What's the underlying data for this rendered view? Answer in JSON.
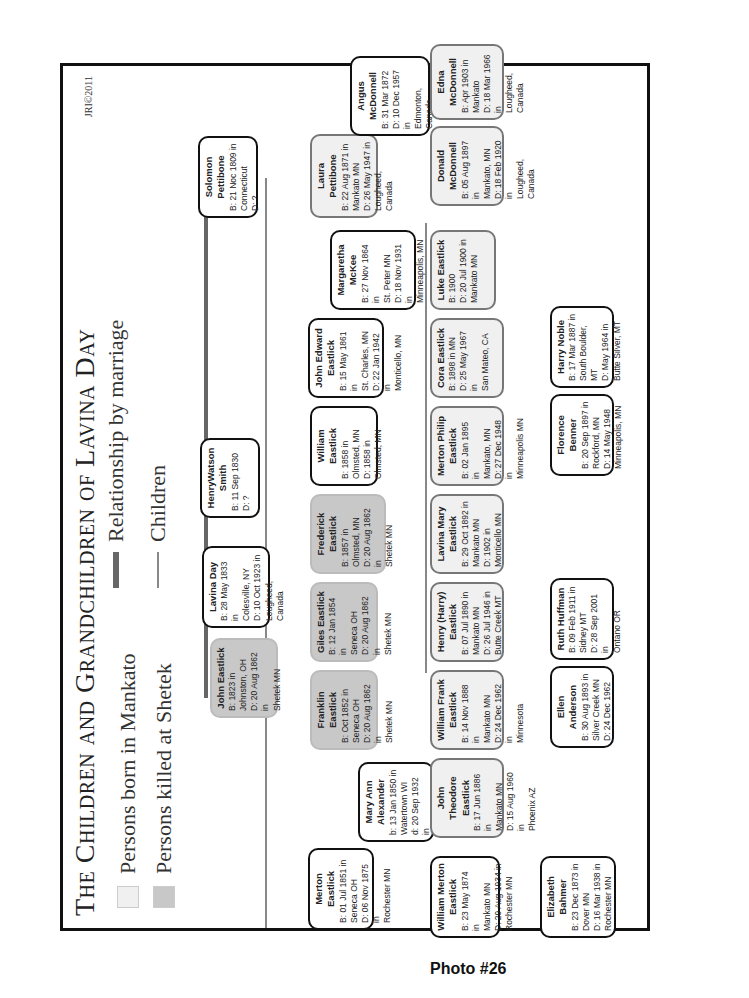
{
  "title": "The Children and Grandchildren of Lavina Day",
  "credit": "JRI©2011",
  "legend": {
    "born_mankato": "Persons born in Mankato",
    "killed_shetek": "Persons killed at Shetek",
    "marriage": "Relationship by marriage",
    "children": "Children"
  },
  "colors": {
    "mankato": "#f0f0f0",
    "shetek": "#c8c8c8",
    "marriage_line": "#666666",
    "children_line": "#888888"
  },
  "caption": "Photo #26",
  "people": {
    "john_eastlick": {
      "name": "John Eastlick",
      "b": "B: 1823 in",
      "b2": "Johnston, OH",
      "d": "D: 20 Aug 1862 in",
      "d2": "Shetek MN",
      "type": "shetek"
    },
    "lavina_day": {
      "name": "Lavina Day",
      "b": "B: 28 May 1833 in",
      "b2": "Colesville, NY",
      "d": "D: 10 Oct 1923 in",
      "d2": "Lougheed, Canada",
      "type": "normal"
    },
    "henry_watson_smith": {
      "name": "HenryWatson Smith",
      "b": "B: 11 Sep 1830",
      "b2": "",
      "d": "D: ?",
      "d2": "",
      "type": "normal"
    },
    "solomon_pettibone": {
      "name": "Solomon Pettibone",
      "b": "B: 21 Noc 1809 in",
      "b2": "Connecticut",
      "d": "D: ?",
      "d2": "",
      "type": "normal"
    },
    "merton_eastlick": {
      "name": "Merton Eastlick",
      "b": "B: 01 Jul 1851 in",
      "b2": "Seneca OH",
      "d": "D: 06 Nov 1875 in",
      "d2": "Rochester MN",
      "type": "normal"
    },
    "mary_ann_alexander": {
      "name": "Mary Ann Alexander",
      "b": "b: 13 Jan 1850 in",
      "b2": "Watertown WI",
      "d": "d: 20 Sep 1932 in",
      "d2": "Rochester MN",
      "type": "normal"
    },
    "franklin_eastlick": {
      "name": "Franklin Eastlick",
      "b": "B: Oct 1852 in",
      "b2": "Seneca OH",
      "d": "D: 20 Aug 1862 in",
      "d2": "Shetek MN",
      "type": "shetek"
    },
    "giles_eastlick": {
      "name": "Giles Eastlick",
      "b": "B: 12 Jan 1854 in",
      "b2": "Seneca OH",
      "d": "D: 20 Aug 1862 in",
      "d2": "Shetek MN",
      "type": "shetek"
    },
    "frederick_eastlick": {
      "name": "Frederick Eastlick",
      "b": "B: 1857 in",
      "b2": "Olmsted, MN",
      "d": "D: 20 Aug 1862 in",
      "d2": "Shetek MN",
      "type": "shetek"
    },
    "william_eastlick": {
      "name": "William Eastlick",
      "b": "B: 1858 in",
      "b2": "Olmsted, MN",
      "d": "D: 1858 in",
      "d2": "Olmsted, MN",
      "type": "normal"
    },
    "john_edward_eastlick": {
      "name": "John Edward Eastlick",
      "b": "B: 15 May 1861 in",
      "b2": "St. Charles, MN",
      "d": "D: 22 Jan 1942 in",
      "d2": "Monticello, MN",
      "type": "normal"
    },
    "margaretha_mckee": {
      "name": "Margaretha McKee",
      "b": "B: 27 Nov 1864 in",
      "b2": "St. Peter MN",
      "d": "D: 18 Nov 1931 in",
      "d2": "Minneapolis, MN",
      "type": "normal"
    },
    "laura_pettibone": {
      "name": "Laura Pettibone",
      "b": "B: 22 Aug 1871 in",
      "b2": "Mankato MN",
      "d": "D: 26 May 1947 in",
      "d2": "Lougheed, Canada",
      "type": "mankato"
    },
    "angus_mcdonnell": {
      "name": "Angus McDonnell",
      "b": "B: 31 Mar 1872",
      "b2": "",
      "d": "D: 10 Dec 1957 in",
      "d2": "Edmonton, Canada",
      "type": "normal"
    },
    "william_merton_eastlick": {
      "name": "William Merton Eastlick",
      "b": "B: 23 May 1874 in",
      "b2": "Mankato MN",
      "d": "D: 29 Aug 1934 in",
      "d2": "Rochester MN",
      "type": "normal"
    },
    "john_theodore_eastlick": {
      "name": "John Theodore Eastlick",
      "b": "B: 17 Jun 1886 in",
      "b2": "Mankato MN",
      "d": "D: 15 Aug 1960 in",
      "d2": "Phoenix AZ",
      "type": "mankato"
    },
    "william_frank_eastlick": {
      "name": "William Frank Eastlick",
      "b": "B: 14 Nov 1888 in",
      "b2": "Mankato MN",
      "d": "D: 24 Dec 1962 in",
      "d2": "Minnesota",
      "type": "mankato"
    },
    "henry_harry_eastlick": {
      "name": "Henry (Harry) Eastlick",
      "b": "B: 07 Jul 1890 in",
      "b2": "Mankato MN",
      "d": "D: 26 Jul 1946 in",
      "d2": "Butte Creek MT",
      "type": "mankato"
    },
    "lavina_mary_eastlick": {
      "name": "Lavina Mary Eastlick",
      "b": "B: 29 Oct 1892 in",
      "b2": "Mankato MN",
      "d": "D: 1902 in",
      "d2": "Monticello MN",
      "type": "mankato"
    },
    "merton_philip_eastlick": {
      "name": "Merton Philip Eastlick",
      "b": "B: 02 Jan 1895 in",
      "b2": "Mankato, MN",
      "d": "D: 27 Dec 1948 in",
      "d2": "Minneapolis MN",
      "type": "mankato"
    },
    "cora_eastlick": {
      "name": "Cora Eastlick",
      "b": "B: 1898 in MN",
      "b2": "",
      "d": "D: 25 May 1967 in",
      "d2": "San Mateo, CA",
      "type": "mankato"
    },
    "luke_eastlick": {
      "name": "Luke Eastlick",
      "b": "B: 1900",
      "b2": "",
      "d": "D: 20 Jul 1900 in",
      "d2": "Mankato MN",
      "type": "mankato"
    },
    "donald_mcdonnell": {
      "name": "Donald McDonnell",
      "b": "B: 05 Aug 1897 in",
      "b2": "Mankato, MN",
      "d": "D: 18 Feb 1920 in",
      "d2": "Lougheed, Canada",
      "type": "mankato"
    },
    "edna_mcdonnell": {
      "name": "Edna McDonnell",
      "b": "B: Apr 1903 in",
      "b2": "Mankato",
      "d": "D: 18 Mar 1966 in",
      "d2": "Lougheed, Canada",
      "type": "mankato"
    },
    "elizabeth_bahmer": {
      "name": "Elizabeth Bahmer",
      "b": "B: 23 Dec 1873 in",
      "b2": "Dover MN",
      "d": "D: 16 Mar 1938 in",
      "d2": "Rochester MN",
      "type": "normal"
    },
    "ellen_anderson": {
      "name": "Ellen Anderson",
      "b": "B: 30 Aug 1893 in",
      "b2": "Silver Creek MN",
      "d": "D: 24 Dec 1962",
      "d2": "",
      "type": "normal"
    },
    "ruth_huffman": {
      "name": "Ruth Huffman",
      "b": "B: 09 Feb 1911 in",
      "b2": "Sidney MT",
      "d": "D: 28 Sep 2001 in",
      "d2": "Ontano OR",
      "type": "normal"
    },
    "florence_benner": {
      "name": "Florence Benner",
      "b": "B: 20 Sep 1897 in",
      "b2": "Rockford, MN",
      "d": "D: 14 May 1948",
      "d2": "Minneapolis, MN",
      "type": "normal"
    },
    "harry_noble": {
      "name": "Harry Noble",
      "b": "B: 17 Mar 1887 in",
      "b2": "South Boulder, MT",
      "d": "D: May 1964 in",
      "d2": "Butte Silver, MT",
      "type": "normal"
    }
  }
}
